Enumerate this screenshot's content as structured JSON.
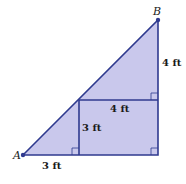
{
  "diagram": {
    "points": {
      "A": {
        "label": "A",
        "x": 23,
        "y": 155
      },
      "B": {
        "label": "B",
        "x": 158,
        "y": 20
      }
    },
    "labels": {
      "bottom_left": "3 ft",
      "inner_vertical": "3 ft",
      "inner_horizontal": "4 ft",
      "right_upper": "4 ft"
    },
    "colors": {
      "fill": "#c9c8ec",
      "stroke": "#2f3a8f",
      "point": "#2f3a8f"
    }
  }
}
